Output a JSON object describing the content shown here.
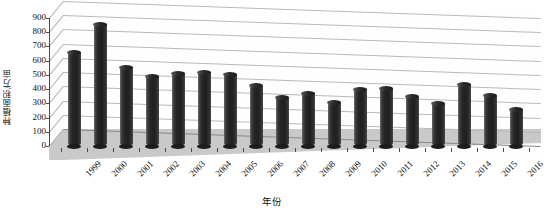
{
  "chart_data": {
    "type": "bar",
    "title": "",
    "xlabel": "年份",
    "ylabel": "种植面积/万亩",
    "ylim": [
      0,
      900
    ],
    "ytick_step": 100,
    "yticks": [
      "900",
      "800",
      "700",
      "600",
      "500",
      "400",
      "300",
      "200",
      "100",
      "0"
    ],
    "grid": true,
    "legend": "none",
    "style": "3d-cylinder",
    "categories": [
      "1999",
      "2000",
      "2001",
      "2002",
      "2003",
      "2004",
      "2005",
      "2006",
      "2007",
      "2008",
      "2009",
      "2010",
      "2011",
      "2012",
      "2013",
      "2014",
      "2015",
      "2016"
    ],
    "values": [
      660,
      855,
      555,
      490,
      512,
      520,
      505,
      425,
      340,
      370,
      305,
      400,
      405,
      345,
      298,
      435,
      355,
      255
    ],
    "series": [
      {
        "name": "种植面积",
        "values": [
          660,
          855,
          555,
          490,
          512,
          520,
          505,
          425,
          340,
          370,
          305,
          400,
          405,
          345,
          298,
          435,
          355,
          255
        ]
      }
    ]
  },
  "colors": {
    "bar_dark": "#1f1f1f",
    "bar_highlight": "#6d6d6d",
    "gridline": "#b9b9b9",
    "floor": "#c9c9c9",
    "axis": "#4a4a4a",
    "background": "#ffffff",
    "text": "#111111"
  }
}
